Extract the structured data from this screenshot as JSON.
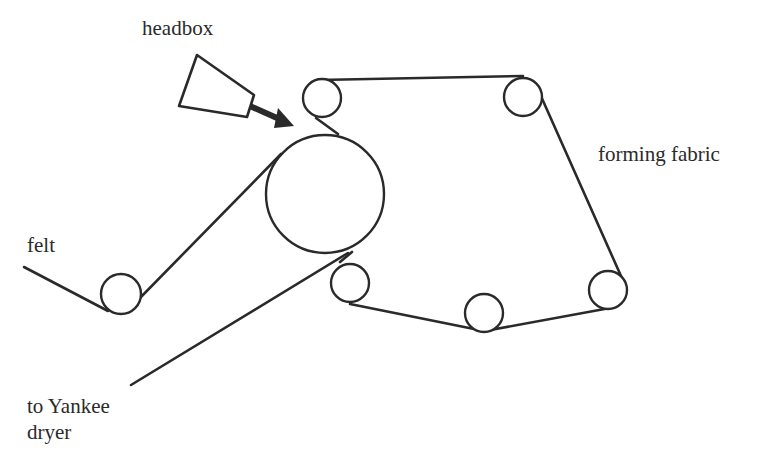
{
  "diagram": {
    "labels": {
      "headbox": "headbox",
      "forming_fabric": "forming fabric",
      "felt": "felt",
      "to_yankee_line1": "to Yankee",
      "to_yankee_line2": "dryer"
    },
    "components": [
      {
        "id": "headbox",
        "shape": "trapezoid"
      },
      {
        "id": "forming-roll",
        "shape": "large-circle"
      },
      {
        "id": "felt-roll",
        "shape": "small-circle"
      },
      {
        "id": "fabric-roll-top-left",
        "shape": "small-circle"
      },
      {
        "id": "fabric-roll-top-right",
        "shape": "small-circle"
      },
      {
        "id": "fabric-roll-right",
        "shape": "small-circle"
      },
      {
        "id": "fabric-roll-bottom",
        "shape": "small-circle"
      },
      {
        "id": "fabric-roll-bottom-left",
        "shape": "small-circle"
      }
    ],
    "colors": {
      "line": "#2a2a2a",
      "background": "#ffffff"
    }
  }
}
